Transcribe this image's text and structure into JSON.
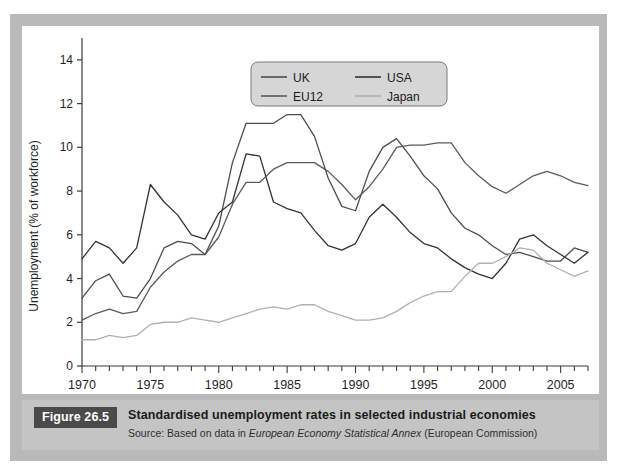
{
  "figure": {
    "badge": "Figure 26.5",
    "title": "Standardised unemployment rates in selected industrial economies",
    "source_prefix": "Source: Based on data in ",
    "source_italic": "European Economy Statistical Annex",
    "source_suffix": " (European Commission)"
  },
  "colors": {
    "frame": "#b9b9b9",
    "caption_band": "#c4c4c4",
    "badge_bg": "#4a4a4a",
    "plot_bg": "#ffffff",
    "axis": "#3b3b3b",
    "uk": "#4d4d4d",
    "usa": "#333333",
    "eu12": "#5a5a5a",
    "japan": "#b0b0b0",
    "legend_bg": "#d6d6d6",
    "legend_border": "#7a7a7a"
  },
  "legend": {
    "position": "top-center",
    "entries": [
      {
        "label": "UK",
        "color": "#4d4d4d"
      },
      {
        "label": "USA",
        "color": "#333333"
      },
      {
        "label": "EU12",
        "color": "#5a5a5a"
      },
      {
        "label": "Japan",
        "color": "#b0b0b0"
      }
    ]
  },
  "chart_data": {
    "type": "line",
    "title": "Standardised unemployment rates in selected industrial economies",
    "xlabel": "",
    "ylabel": "Unemployment (% of workforce)",
    "xlim": [
      1970,
      2007
    ],
    "ylim": [
      0,
      15
    ],
    "grid": false,
    "legend_position": "top-center",
    "x_major_ticks": [
      1970,
      1975,
      1980,
      1985,
      1990,
      1995,
      2000,
      2005
    ],
    "x_tick_labels": [
      "1970",
      "1975",
      "1980",
      "1985",
      "1990",
      "1995",
      "2000",
      "2005"
    ],
    "x_minor_tick_step": 1,
    "y_ticks": [
      0,
      2,
      4,
      6,
      8,
      10,
      12,
      14
    ],
    "y_tick_labels": [
      "0",
      "2",
      "4",
      "6",
      "8",
      "10",
      "12",
      "14"
    ],
    "x": [
      1970,
      1971,
      1972,
      1973,
      1974,
      1975,
      1976,
      1977,
      1978,
      1979,
      1980,
      1981,
      1982,
      1983,
      1984,
      1985,
      1986,
      1987,
      1988,
      1989,
      1990,
      1991,
      1992,
      1993,
      1994,
      1995,
      1996,
      1997,
      1998,
      1999,
      2000,
      2001,
      2002,
      2003,
      2004,
      2005,
      2006,
      2007
    ],
    "series": [
      {
        "name": "UK",
        "color": "#4d4d4d",
        "values": [
          3.1,
          3.9,
          4.2,
          3.2,
          3.1,
          4.0,
          5.4,
          5.7,
          5.6,
          5.1,
          6.4,
          9.3,
          11.1,
          11.1,
          11.1,
          11.5,
          11.5,
          10.5,
          8.6,
          7.3,
          7.1,
          8.9,
          10.0,
          10.4,
          9.6,
          8.7,
          8.1,
          7.0,
          6.3,
          6.0,
          5.5,
          5.1,
          5.2,
          5.0,
          4.8,
          4.8,
          5.4,
          5.2
        ]
      },
      {
        "name": "USA",
        "color": "#333333",
        "values": [
          4.9,
          5.7,
          5.4,
          4.7,
          5.4,
          8.3,
          7.5,
          6.9,
          6.0,
          5.8,
          7.0,
          7.5,
          9.7,
          9.6,
          7.5,
          7.2,
          7.0,
          6.2,
          5.5,
          5.3,
          5.6,
          6.8,
          7.4,
          6.8,
          6.1,
          5.6,
          5.4,
          4.9,
          4.5,
          4.2,
          4.0,
          4.7,
          5.8,
          6.0,
          5.5,
          5.1,
          4.7,
          5.2
        ]
      },
      {
        "name": "EU12",
        "color": "#5a5a5a",
        "values": [
          2.1,
          2.4,
          2.6,
          2.4,
          2.5,
          3.6,
          4.3,
          4.8,
          5.1,
          5.1,
          5.9,
          7.4,
          8.4,
          8.4,
          9.0,
          9.3,
          9.3,
          9.3,
          8.9,
          8.3,
          7.6,
          8.2,
          9.0,
          10.0,
          10.1,
          10.1,
          10.2,
          10.2,
          9.3,
          8.7,
          8.2,
          7.9,
          8.3,
          8.7,
          8.9,
          8.7,
          8.4,
          8.25
        ]
      },
      {
        "name": "Japan",
        "color": "#b0b0b0",
        "values": [
          1.2,
          1.2,
          1.4,
          1.3,
          1.4,
          1.9,
          2.0,
          2.0,
          2.2,
          2.1,
          2.0,
          2.2,
          2.4,
          2.6,
          2.7,
          2.6,
          2.8,
          2.8,
          2.5,
          2.3,
          2.1,
          2.1,
          2.2,
          2.5,
          2.9,
          3.2,
          3.4,
          3.4,
          4.1,
          4.7,
          4.7,
          5.0,
          5.4,
          5.3,
          4.7,
          4.4,
          4.1,
          4.35
        ]
      }
    ]
  }
}
